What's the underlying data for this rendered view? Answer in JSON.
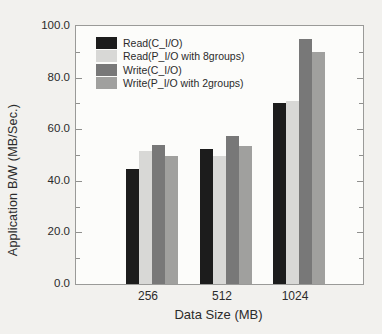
{
  "chart_data": {
    "type": "bar",
    "title": "",
    "xlabel": "Data Size (MB)",
    "ylabel": "Application B/W (MB/Sec.)",
    "categories": [
      "256",
      "512",
      "1024"
    ],
    "series": [
      {
        "name": "Read(C_I/O)",
        "color": "#1c1c1c",
        "values": [
          44.5,
          52.5,
          70.0
        ]
      },
      {
        "name": "Read(P_I/O with 8groups)",
        "color": "#d8d8d6",
        "values": [
          51.5,
          49.5,
          71.0
        ]
      },
      {
        "name": "Write(C_I/O)",
        "color": "#787878",
        "values": [
          54.0,
          57.5,
          95.0
        ]
      },
      {
        "name": "Write(P_I/O with 2groups)",
        "color": "#a0a09e",
        "values": [
          49.5,
          53.5,
          90.0
        ]
      }
    ],
    "ylim": [
      0,
      100
    ],
    "yticks": [
      0,
      20,
      40,
      60,
      80,
      100
    ],
    "ytick_labels": [
      "0.0",
      "20.0",
      "40.0",
      "60.0",
      "80.0",
      "100.0"
    ],
    "minor_tick_step": 10,
    "legend_position": "top-left",
    "grid": false,
    "frame_color": "#9a9a98",
    "plot_background": "#fcfcfa",
    "page_background": "#f2f1ee"
  }
}
